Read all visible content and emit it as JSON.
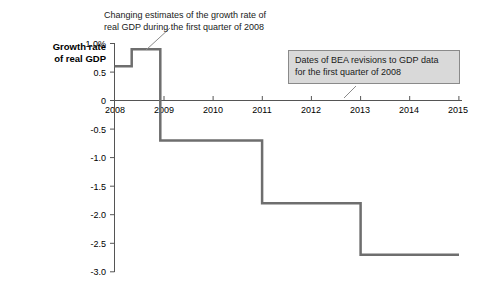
{
  "chart_data": {
    "type": "line",
    "subtype": "step",
    "title": "",
    "xlabel": "",
    "ylabel": "Growth rate of real GDP",
    "ylabel_lines": [
      "Growth rate",
      "of real GDP"
    ],
    "xlim": [
      2008,
      2015
    ],
    "ylim": [
      -3.0,
      1.0
    ],
    "grid": false,
    "yticks": [
      "1.0%",
      "0.5",
      "0",
      "-0.5",
      "-1.0",
      "-1.5",
      "-2.0",
      "-2.5",
      "-3.0"
    ],
    "ytick_values": [
      1.0,
      0.5,
      0,
      -0.5,
      -1.0,
      -1.5,
      -2.0,
      -2.5,
      -3.0
    ],
    "xticks": [
      "2008",
      "2009",
      "2010",
      "2011",
      "2012",
      "2013",
      "2014",
      "2015"
    ],
    "xtick_values": [
      2008,
      2009,
      2010,
      2011,
      2012,
      2013,
      2014,
      2015
    ],
    "series": [
      {
        "name": "Estimate of 2008 Q1 real GDP growth rate",
        "line_color": "#6e6e6e",
        "line_width": 2.5,
        "step_points": [
          {
            "x": 2008.0,
            "y": 0.6
          },
          {
            "x": 2008.35,
            "y": 0.6
          },
          {
            "x": 2008.35,
            "y": 0.9
          },
          {
            "x": 2008.93,
            "y": 0.9
          },
          {
            "x": 2008.93,
            "y": -0.7
          },
          {
            "x": 2011.0,
            "y": -0.7
          },
          {
            "x": 2011.0,
            "y": -1.8
          },
          {
            "x": 2013.0,
            "y": -1.8
          },
          {
            "x": 2013.0,
            "y": -2.7
          },
          {
            "x": 2015.0,
            "y": -2.7
          }
        ]
      }
    ],
    "annotations": [
      {
        "id": "growth-estimates-note",
        "style": "plain",
        "lines": [
          "Changing estimates of the growth rate of",
          "real GDP during the first quarter of 2008"
        ],
        "leader": true
      },
      {
        "id": "bea-revision-dates-note",
        "style": "box",
        "box_fill": "#d9d9d9",
        "box_border": "#8a8a8a",
        "lines": [
          "Dates of BEA revisions to GDP data",
          "for the first quarter of 2008"
        ],
        "leader": true
      }
    ],
    "revision_dates_x": [
      2008.35,
      2008.93,
      2011.0,
      2013.0
    ]
  },
  "colors": {
    "line": "#6e6e6e",
    "axis": "#4d4d4d",
    "box_fill": "#d9d9d9",
    "box_border": "#8a8a8a",
    "text": "#000000",
    "background": "#ffffff"
  }
}
